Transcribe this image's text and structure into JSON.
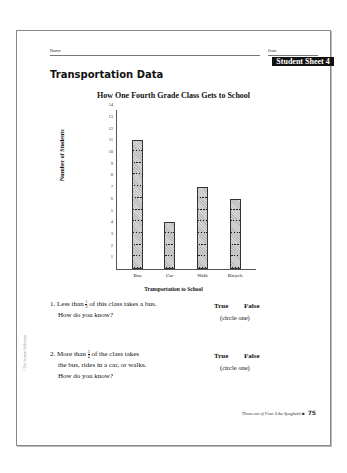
{
  "header": {
    "name_label": "Name",
    "date_label": "Date",
    "sheet_badge": "Student Sheet 4"
  },
  "title": "Transportation Data",
  "chart_data": {
    "type": "bar",
    "title": "How One Fourth Grade Class Gets to School",
    "categories": [
      "Bus",
      "Car",
      "Walk",
      "Bicycle"
    ],
    "values": [
      11,
      4,
      7,
      6
    ],
    "xlabel": "Transportation to School",
    "ylabel": "Number of Students",
    "ylim": [
      0,
      14
    ],
    "yticks": [
      "1",
      "2",
      "3",
      "4",
      "5",
      "6",
      "7",
      "8",
      "9",
      "10",
      "11",
      "12",
      "13",
      "14"
    ],
    "grid": false,
    "legend": "none"
  },
  "questions": [
    {
      "number": "1.",
      "text_before": "Less than",
      "frac_num": "1",
      "frac_den": "3",
      "text_after": "of this class takes a bus.",
      "line2": "How do you know?",
      "true_label": "True",
      "false_label": "False",
      "circle_hint": "(circle one)"
    },
    {
      "number": "2.",
      "text_before": "More than",
      "frac_num": "3",
      "frac_den": "4",
      "text_after": "of the class takes",
      "line2": "the bus, rides in a car, or walks.",
      "line3": "How do you know?",
      "true_label": "True",
      "false_label": "False",
      "circle_hint": "(circle one)"
    }
  ],
  "footer": {
    "book_title": "Three out of Four Like Spaghetti",
    "page_number": "75"
  },
  "copyright": "© Dale Seymour Publications"
}
